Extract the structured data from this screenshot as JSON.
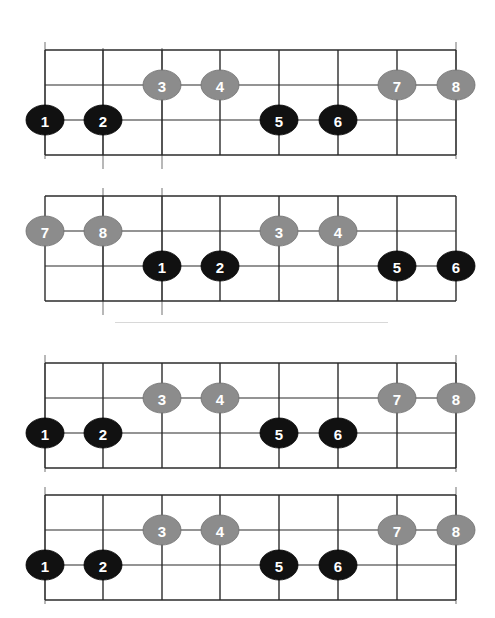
{
  "figure": {
    "background_color": "#ffffff",
    "grid_line_color": "#2b2b2b",
    "marker_line_color": "#9a9a9a",
    "separator_color": "#d8d8d8",
    "black_note_color": "#111111",
    "gray_note_color": "#8c8c8c",
    "note_text_color": "#ffffff",
    "label_text_color": "#1a1a1a"
  },
  "separator": {
    "name": "group-separator",
    "x1": 115,
    "x2": 388,
    "y": 322
  },
  "footer": {
    "caption": ""
  },
  "geometry": {
    "fret_x": [
      45,
      103,
      162,
      220,
      279,
      338,
      397,
      456
    ],
    "string_y_offsets": [
      8,
      43,
      78,
      113
    ],
    "note_rx": 19,
    "note_ry": 15
  },
  "diagrams": [
    {
      "id": "diagram-1",
      "name": "fretboard-diagram-1",
      "top": 42,
      "height": 130,
      "labels_above": [
        {
          "text": "A",
          "fret": 1,
          "name": "label-a-top-left"
        },
        {
          "text": "B",
          "fret": 8,
          "name": "label-b-top-right"
        }
      ],
      "labels_below": [
        {
          "text": "B",
          "fret": 2,
          "name": "label-b-bottom"
        },
        {
          "text": "A",
          "fret": 3,
          "name": "label-a-bottom"
        }
      ],
      "marker_lines": [
        {
          "fret": 1,
          "extend": "up"
        },
        {
          "fret": 8,
          "extend": "up"
        },
        {
          "fret": 2,
          "extend": "down"
        },
        {
          "fret": 3,
          "extend": "down"
        }
      ],
      "notes": [
        {
          "label": "1",
          "fret": 1,
          "string": 3,
          "color": "black"
        },
        {
          "label": "2",
          "fret": 2,
          "string": 3,
          "color": "black"
        },
        {
          "label": "3",
          "fret": 3,
          "string": 2,
          "color": "gray"
        },
        {
          "label": "4",
          "fret": 4,
          "string": 2,
          "color": "gray"
        },
        {
          "label": "5",
          "fret": 5,
          "string": 3,
          "color": "black"
        },
        {
          "label": "6",
          "fret": 6,
          "string": 3,
          "color": "black"
        },
        {
          "label": "7",
          "fret": 7,
          "string": 2,
          "color": "gray"
        },
        {
          "label": "8",
          "fret": 8,
          "string": 2,
          "color": "gray"
        }
      ]
    },
    {
      "id": "diagram-2",
      "name": "fretboard-diagram-2",
      "top": 188,
      "height": 130,
      "labels_above": [
        {
          "text": "B",
          "fret": 2,
          "name": "label-b-top"
        },
        {
          "text": "A",
          "fret": 3,
          "name": "label-a-top"
        }
      ],
      "labels_below": [],
      "marker_lines": [
        {
          "fret": 2,
          "extend": "both"
        },
        {
          "fret": 3,
          "extend": "both"
        }
      ],
      "notes": [
        {
          "label": "7",
          "fret": 1,
          "string": 2,
          "color": "gray"
        },
        {
          "label": "8",
          "fret": 2,
          "string": 2,
          "color": "gray"
        },
        {
          "label": "1",
          "fret": 3,
          "string": 3,
          "color": "black"
        },
        {
          "label": "2",
          "fret": 4,
          "string": 3,
          "color": "black"
        },
        {
          "label": "3",
          "fret": 5,
          "string": 2,
          "color": "gray"
        },
        {
          "label": "4",
          "fret": 6,
          "string": 2,
          "color": "gray"
        },
        {
          "label": "5",
          "fret": 7,
          "string": 3,
          "color": "black"
        },
        {
          "label": "6",
          "fret": 8,
          "string": 3,
          "color": "black"
        }
      ]
    },
    {
      "id": "diagram-3",
      "name": "fretboard-diagram-3",
      "top": 355,
      "height": 130,
      "labels_above": [
        {
          "text": "A",
          "fret": 1,
          "name": "label-a-top-left"
        },
        {
          "text": "B",
          "fret": 8,
          "name": "label-b-top-right"
        }
      ],
      "labels_below": [],
      "marker_lines": [
        {
          "fret": 1,
          "extend": "up"
        },
        {
          "fret": 8,
          "extend": "up"
        }
      ],
      "notes": [
        {
          "label": "1",
          "fret": 1,
          "string": 3,
          "color": "black"
        },
        {
          "label": "2",
          "fret": 2,
          "string": 3,
          "color": "black"
        },
        {
          "label": "3",
          "fret": 3,
          "string": 2,
          "color": "gray"
        },
        {
          "label": "4",
          "fret": 4,
          "string": 2,
          "color": "gray"
        },
        {
          "label": "5",
          "fret": 5,
          "string": 3,
          "color": "black"
        },
        {
          "label": "6",
          "fret": 6,
          "string": 3,
          "color": "black"
        },
        {
          "label": "7",
          "fret": 7,
          "string": 2,
          "color": "gray"
        },
        {
          "label": "8",
          "fret": 8,
          "string": 2,
          "color": "gray"
        }
      ]
    },
    {
      "id": "diagram-4",
      "name": "fretboard-diagram-4",
      "top": 487,
      "height": 130,
      "labels_above": [
        {
          "text": "A",
          "fret": 1,
          "name": "label-a-top-left"
        },
        {
          "text": "B",
          "fret": 8,
          "name": "label-b-top-right"
        }
      ],
      "labels_below": [],
      "marker_lines": [
        {
          "fret": 1,
          "extend": "up"
        },
        {
          "fret": 8,
          "extend": "up"
        }
      ],
      "notes": [
        {
          "label": "1",
          "fret": 1,
          "string": 3,
          "color": "black"
        },
        {
          "label": "2",
          "fret": 2,
          "string": 3,
          "color": "black"
        },
        {
          "label": "3",
          "fret": 3,
          "string": 2,
          "color": "gray"
        },
        {
          "label": "4",
          "fret": 4,
          "string": 2,
          "color": "gray"
        },
        {
          "label": "5",
          "fret": 5,
          "string": 3,
          "color": "black"
        },
        {
          "label": "6",
          "fret": 6,
          "string": 3,
          "color": "black"
        },
        {
          "label": "7",
          "fret": 7,
          "string": 2,
          "color": "gray"
        },
        {
          "label": "8",
          "fret": 8,
          "string": 2,
          "color": "gray"
        }
      ]
    }
  ]
}
